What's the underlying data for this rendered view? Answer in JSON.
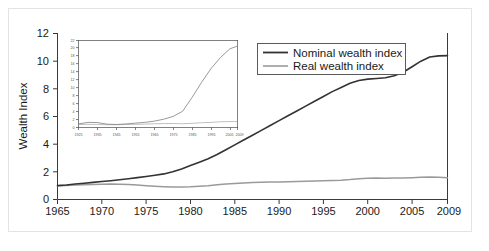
{
  "chart_data": {
    "type": "line",
    "title": "",
    "xlabel": "",
    "ylabel": "Wealth Index",
    "xlim": [
      1965,
      2009
    ],
    "ylim": [
      0,
      12
    ],
    "grid": false,
    "legend_position": "top-right",
    "x_ticks": [
      "1965",
      "1970",
      "1975",
      "1980",
      "1985",
      "1990",
      "1995",
      "2000",
      "2005",
      "2009"
    ],
    "y_ticks": [
      "0",
      "2",
      "4",
      "6",
      "8",
      "10",
      "12"
    ],
    "x": [
      1965,
      1966,
      1967,
      1968,
      1969,
      1970,
      1971,
      1972,
      1973,
      1974,
      1975,
      1976,
      1977,
      1978,
      1979,
      1980,
      1981,
      1982,
      1983,
      1984,
      1985,
      1986,
      1987,
      1988,
      1989,
      1990,
      1991,
      1992,
      1993,
      1994,
      1995,
      1996,
      1997,
      1998,
      1999,
      2000,
      2001,
      2002,
      2003,
      2004,
      2005,
      2006,
      2007,
      2008,
      2009
    ],
    "series": [
      {
        "name": "Nominal wealth index",
        "color": "#333333",
        "values": [
          1.0,
          1.05,
          1.12,
          1.18,
          1.24,
          1.3,
          1.36,
          1.43,
          1.5,
          1.58,
          1.66,
          1.75,
          1.85,
          2.0,
          2.2,
          2.45,
          2.7,
          2.95,
          3.25,
          3.6,
          3.95,
          4.3,
          4.65,
          5.0,
          5.35,
          5.7,
          6.05,
          6.4,
          6.75,
          7.1,
          7.45,
          7.8,
          8.1,
          8.4,
          8.6,
          8.7,
          8.75,
          8.8,
          8.95,
          9.2,
          9.6,
          10.0,
          10.3,
          10.38,
          10.4
        ]
      },
      {
        "name": "Real wealth index",
        "color": "#9a9a9a",
        "values": [
          1.0,
          1.02,
          1.04,
          1.06,
          1.08,
          1.1,
          1.12,
          1.1,
          1.08,
          1.04,
          1.0,
          0.96,
          0.93,
          0.91,
          0.9,
          0.92,
          0.96,
          1.0,
          1.06,
          1.12,
          1.16,
          1.2,
          1.22,
          1.24,
          1.26,
          1.27,
          1.28,
          1.3,
          1.32,
          1.34,
          1.36,
          1.38,
          1.4,
          1.44,
          1.5,
          1.54,
          1.55,
          1.54,
          1.55,
          1.56,
          1.58,
          1.6,
          1.62,
          1.6,
          1.58
        ]
      }
    ],
    "legend_entries": [
      {
        "label": "Nominal wealth index",
        "color": "#333333"
      },
      {
        "label": "Real wealth index",
        "color": "#9a9a9a"
      }
    ],
    "inset": {
      "type": "line",
      "xlim": [
        1925,
        2009
      ],
      "ylim": [
        0,
        22
      ],
      "x_ticks": [
        "1925",
        "1935",
        "1945",
        "1955",
        "1965",
        "1975",
        "1985",
        "1995",
        "2005",
        "2009"
      ],
      "y_ticks": [
        "0",
        "2",
        "4",
        "6",
        "8",
        "10",
        "12",
        "14",
        "16",
        "18",
        "20",
        "22"
      ],
      "x": [
        1925,
        1930,
        1935,
        1940,
        1945,
        1950,
        1955,
        1960,
        1965,
        1970,
        1975,
        1980,
        1985,
        1990,
        1995,
        2000,
        2005,
        2009
      ],
      "series": [
        {
          "name": "Nominal wealth index",
          "color": "#7f7f7f",
          "values": [
            0.9,
            1.3,
            1.25,
            0.85,
            0.75,
            0.9,
            1.1,
            1.3,
            1.6,
            2.1,
            2.8,
            4.1,
            7.6,
            11.4,
            14.9,
            17.7,
            19.9,
            20.6
          ]
        },
        {
          "name": "Real wealth index",
          "color": "#b0b0b0",
          "values": [
            0.75,
            0.8,
            0.78,
            0.7,
            0.7,
            0.75,
            0.8,
            0.85,
            0.95,
            1.0,
            1.0,
            0.95,
            1.05,
            1.2,
            1.3,
            1.45,
            1.5,
            1.5
          ]
        }
      ]
    }
  }
}
